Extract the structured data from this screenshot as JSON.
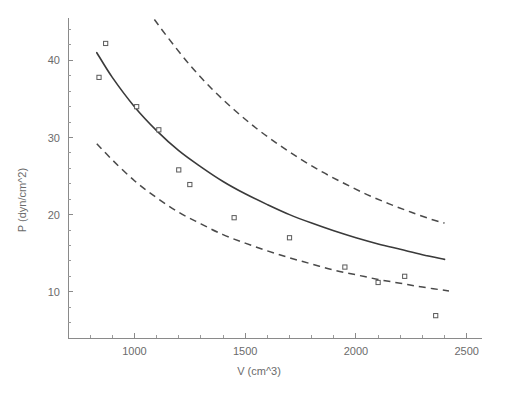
{
  "chart_data": {
    "type": "scatter",
    "title": "",
    "subtitle": "",
    "xlabel": "V (cm^3)",
    "ylabel": "P (dyn/cm^2)",
    "xlim": [
      700,
      2560
    ],
    "ylim": [
      4,
      45.5
    ],
    "grid": false,
    "legend": "none",
    "x_ticks_major": [
      1000,
      1500,
      2000,
      2500
    ],
    "x_tick_labels": [
      "1000",
      "1500",
      "2000",
      "2500"
    ],
    "x_minor_step": 100,
    "y_ticks_major": [
      10,
      20,
      30,
      40
    ],
    "y_tick_labels": [
      "10",
      "20",
      "30",
      "40"
    ],
    "y_minor_step": 2,
    "series": [
      {
        "name": "observed data",
        "type": "scatter",
        "marker": "open-square",
        "points": [
          {
            "x": 840,
            "y": 37.8
          },
          {
            "x": 870,
            "y": 42.2
          },
          {
            "x": 1010,
            "y": 34.0
          },
          {
            "x": 1110,
            "y": 31.0
          },
          {
            "x": 1200,
            "y": 25.8
          },
          {
            "x": 1250,
            "y": 23.9
          },
          {
            "x": 1450,
            "y": 19.6
          },
          {
            "x": 1700,
            "y": 17.0
          },
          {
            "x": 1950,
            "y": 13.2
          },
          {
            "x": 2100,
            "y": 11.2
          },
          {
            "x": 2220,
            "y": 12.0
          },
          {
            "x": 2360,
            "y": 6.9
          }
        ]
      },
      {
        "name": "fitted curve",
        "type": "line",
        "style": "solid",
        "model": "P = k / V",
        "k": 34000,
        "x_range": [
          830,
          2400
        ],
        "points": [
          {
            "x": 830,
            "y": 41.0
          },
          {
            "x": 900,
            "y": 37.8
          },
          {
            "x": 1000,
            "y": 34.0
          },
          {
            "x": 1100,
            "y": 30.9
          },
          {
            "x": 1200,
            "y": 28.3
          },
          {
            "x": 1300,
            "y": 26.2
          },
          {
            "x": 1400,
            "y": 24.3
          },
          {
            "x": 1500,
            "y": 22.7
          },
          {
            "x": 1600,
            "y": 21.3
          },
          {
            "x": 1700,
            "y": 20.0
          },
          {
            "x": 1800,
            "y": 18.9
          },
          {
            "x": 1900,
            "y": 17.9
          },
          {
            "x": 2000,
            "y": 17.0
          },
          {
            "x": 2100,
            "y": 16.2
          },
          {
            "x": 2200,
            "y": 15.5
          },
          {
            "x": 2300,
            "y": 14.8
          },
          {
            "x": 2400,
            "y": 14.2
          }
        ]
      },
      {
        "name": "upper confidence band",
        "type": "line",
        "style": "dashed",
        "x_range": [
          1090,
          2400
        ],
        "points": [
          {
            "x": 1090,
            "y": 45.3
          },
          {
            "x": 1150,
            "y": 43.0
          },
          {
            "x": 1250,
            "y": 39.4
          },
          {
            "x": 1350,
            "y": 36.3
          },
          {
            "x": 1450,
            "y": 33.6
          },
          {
            "x": 1550,
            "y": 31.2
          },
          {
            "x": 1650,
            "y": 29.1
          },
          {
            "x": 1750,
            "y": 27.2
          },
          {
            "x": 1850,
            "y": 25.5
          },
          {
            "x": 1950,
            "y": 24.0
          },
          {
            "x": 2050,
            "y": 22.6
          },
          {
            "x": 2150,
            "y": 21.4
          },
          {
            "x": 2250,
            "y": 20.3
          },
          {
            "x": 2350,
            "y": 19.3
          },
          {
            "x": 2400,
            "y": 18.9
          }
        ]
      },
      {
        "name": "lower confidence band",
        "type": "line",
        "style": "dashed",
        "x_range": [
          830,
          2420
        ],
        "points": [
          {
            "x": 830,
            "y": 29.2
          },
          {
            "x": 900,
            "y": 27.1
          },
          {
            "x": 1000,
            "y": 24.4
          },
          {
            "x": 1100,
            "y": 22.2
          },
          {
            "x": 1200,
            "y": 20.3
          },
          {
            "x": 1300,
            "y": 18.8
          },
          {
            "x": 1400,
            "y": 17.4
          },
          {
            "x": 1500,
            "y": 16.3
          },
          {
            "x": 1600,
            "y": 15.3
          },
          {
            "x": 1700,
            "y": 14.4
          },
          {
            "x": 1800,
            "y": 13.6
          },
          {
            "x": 1900,
            "y": 12.8
          },
          {
            "x": 2000,
            "y": 12.2
          },
          {
            "x": 2100,
            "y": 11.6
          },
          {
            "x": 2200,
            "y": 11.1
          },
          {
            "x": 2300,
            "y": 10.6
          },
          {
            "x": 2420,
            "y": 10.1
          }
        ]
      }
    ],
    "colors": {
      "background": "#ffffff",
      "axis": "#8a8a8a",
      "text": "#6b6b6b",
      "fit_line": "#3a3a3a",
      "band_line": "#4a4a4a",
      "marker_stroke": "#5a5a5a",
      "marker_fill": "#ffffff"
    }
  }
}
